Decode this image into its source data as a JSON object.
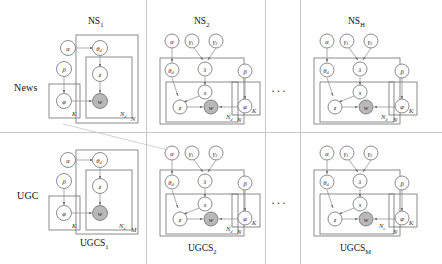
{
  "figure": {
    "type": "plate-notation-graphical-model",
    "row_labels": [
      {
        "id": "news",
        "text": "News"
      },
      {
        "id": "ugc",
        "text": "UGC"
      }
    ],
    "ellipsis": "···",
    "colors": {
      "observed_node_fill": "#b8b8b8",
      "latent_node_fill": "#ffffff",
      "stroke": "#6f6f6f",
      "edge": "#8a8a8a",
      "divider": "#c9c9c9"
    },
    "panels": [
      {
        "id": "ns1",
        "row": "news",
        "title": "NS",
        "title_sub": "1",
        "title_position": "top",
        "nodes": [
          {
            "name": "alpha",
            "label": "α",
            "observed": false
          },
          {
            "name": "theta-d",
            "label": "θ",
            "sub": "d",
            "observed": false
          },
          {
            "name": "beta",
            "label": "β",
            "observed": false
          },
          {
            "name": "phi",
            "label": "φ",
            "observed": false
          },
          {
            "name": "z",
            "label": "z",
            "observed": false
          },
          {
            "name": "w",
            "label": "w",
            "observed": true
          }
        ],
        "plates": [
          {
            "name": "documents-plate",
            "label": "N"
          },
          {
            "name": "words-plate",
            "label": "N",
            "sub": "d"
          },
          {
            "name": "topics-plate",
            "label": "K"
          }
        ],
        "edges": [
          {
            "from": "alpha",
            "to": "theta-d"
          },
          {
            "from": "theta-d",
            "to": "z"
          },
          {
            "from": "z",
            "to": "w"
          },
          {
            "from": "beta",
            "to": "phi"
          },
          {
            "from": "phi",
            "to": "w"
          }
        ]
      },
      {
        "id": "ns2",
        "row": "news",
        "title": "NS",
        "title_sub": "2",
        "title_position": "top",
        "nodes": [
          {
            "name": "alpha",
            "label": "α",
            "observed": false
          },
          {
            "name": "gamma-1",
            "label": "γ",
            "sub": "1",
            "observed": false
          },
          {
            "name": "gamma-2",
            "label": "γ",
            "sub": "2",
            "observed": false
          },
          {
            "name": "theta-d",
            "label": "θ",
            "sub": "d",
            "observed": false
          },
          {
            "name": "lambda",
            "label": "λ",
            "observed": false
          },
          {
            "name": "s",
            "label": "s",
            "observed": false
          },
          {
            "name": "z",
            "label": "z",
            "observed": false
          },
          {
            "name": "w",
            "label": "w",
            "observed": true
          },
          {
            "name": "beta",
            "label": "β",
            "observed": false
          },
          {
            "name": "phi",
            "label": "φ",
            "observed": false
          }
        ],
        "plates": [
          {
            "name": "documents-plate",
            "label": "N"
          },
          {
            "name": "words-plate",
            "label": "N",
            "sub": "d"
          },
          {
            "name": "topics-plate",
            "label": "K"
          }
        ],
        "edges": [
          {
            "from": "alpha",
            "to": "theta-d"
          },
          {
            "from": "gamma-1",
            "to": "lambda"
          },
          {
            "from": "gamma-2",
            "to": "lambda"
          },
          {
            "from": "lambda",
            "to": "s"
          },
          {
            "from": "theta-d",
            "to": "z"
          },
          {
            "from": "s",
            "to": "z"
          },
          {
            "from": "z",
            "to": "w"
          },
          {
            "from": "beta",
            "to": "phi"
          },
          {
            "from": "phi",
            "to": "w"
          }
        ]
      },
      {
        "id": "nsh",
        "row": "news",
        "title": "NS",
        "title_sub": "H",
        "title_position": "top",
        "nodes": [
          {
            "name": "alpha",
            "label": "α",
            "observed": false
          },
          {
            "name": "gamma-1",
            "label": "γ",
            "sub": "1",
            "observed": false
          },
          {
            "name": "gamma-2",
            "label": "γ",
            "sub": "2",
            "observed": false
          },
          {
            "name": "theta-d",
            "label": "θ",
            "sub": "d",
            "observed": false
          },
          {
            "name": "lambda",
            "label": "λ",
            "observed": false
          },
          {
            "name": "s",
            "label": "s",
            "observed": false
          },
          {
            "name": "z",
            "label": "z",
            "observed": false
          },
          {
            "name": "w",
            "label": "w",
            "observed": true
          },
          {
            "name": "beta",
            "label": "β",
            "observed": false
          },
          {
            "name": "phi",
            "label": "φ",
            "observed": false
          }
        ],
        "plates": [
          {
            "name": "documents-plate",
            "label": "N"
          },
          {
            "name": "words-plate",
            "label": "N",
            "sub": "d"
          },
          {
            "name": "topics-plate",
            "label": "K"
          }
        ],
        "edges": [
          {
            "from": "alpha",
            "to": "theta-d"
          },
          {
            "from": "gamma-1",
            "to": "lambda"
          },
          {
            "from": "gamma-2",
            "to": "lambda"
          },
          {
            "from": "lambda",
            "to": "s"
          },
          {
            "from": "theta-d",
            "to": "z"
          },
          {
            "from": "s",
            "to": "z"
          },
          {
            "from": "z",
            "to": "w"
          },
          {
            "from": "beta",
            "to": "phi"
          },
          {
            "from": "phi",
            "to": "w"
          }
        ]
      },
      {
        "id": "ugcs1",
        "row": "ugc",
        "title": "UGCS",
        "title_sub": "1",
        "title_position": "bottom",
        "nodes": [
          {
            "name": "alpha",
            "label": "α",
            "observed": false
          },
          {
            "name": "theta-d",
            "label": "θ",
            "sub": "d",
            "observed": false
          },
          {
            "name": "beta",
            "label": "β",
            "observed": false
          },
          {
            "name": "phi",
            "label": "φ",
            "observed": false
          },
          {
            "name": "z",
            "label": "z",
            "observed": false
          },
          {
            "name": "w",
            "label": "w",
            "observed": true
          }
        ],
        "plates": [
          {
            "name": "documents-plate",
            "label": "M"
          },
          {
            "name": "words-plate",
            "label": "N",
            "sub": "d"
          },
          {
            "name": "topics-plate",
            "label": "K"
          }
        ],
        "edges": [
          {
            "from": "alpha",
            "to": "theta-d"
          },
          {
            "from": "theta-d",
            "to": "z"
          },
          {
            "from": "z",
            "to": "w"
          },
          {
            "from": "beta",
            "to": "phi"
          },
          {
            "from": "phi",
            "to": "w"
          }
        ]
      },
      {
        "id": "ugcs2",
        "row": "ugc",
        "title": "UGCS",
        "title_sub": "2",
        "title_position": "bottom",
        "nodes": [
          {
            "name": "alpha",
            "label": "α",
            "observed": false
          },
          {
            "name": "gamma-1",
            "label": "γ",
            "sub": "1",
            "observed": false
          },
          {
            "name": "gamma-2",
            "label": "γ",
            "sub": "2",
            "observed": false
          },
          {
            "name": "theta-d",
            "label": "θ",
            "sub": "d",
            "observed": false
          },
          {
            "name": "lambda",
            "label": "λ",
            "observed": false
          },
          {
            "name": "s",
            "label": "s",
            "observed": false
          },
          {
            "name": "z",
            "label": "z",
            "observed": false
          },
          {
            "name": "w",
            "label": "w",
            "observed": true
          },
          {
            "name": "beta",
            "label": "β",
            "observed": false
          },
          {
            "name": "phi",
            "label": "φ",
            "observed": false
          }
        ],
        "plates": [
          {
            "name": "documents-plate",
            "label": "N"
          },
          {
            "name": "words-plate",
            "label": "N",
            "sub": "d"
          },
          {
            "name": "topics-plate",
            "label": "K"
          }
        ],
        "edges": [
          {
            "from": "alpha",
            "to": "theta-d"
          },
          {
            "from": "gamma-1",
            "to": "lambda"
          },
          {
            "from": "gamma-2",
            "to": "lambda"
          },
          {
            "from": "lambda",
            "to": "s"
          },
          {
            "from": "theta-d",
            "to": "z"
          },
          {
            "from": "s",
            "to": "z"
          },
          {
            "from": "z",
            "to": "w"
          },
          {
            "from": "beta",
            "to": "phi"
          },
          {
            "from": "phi",
            "to": "w"
          }
        ]
      },
      {
        "id": "ugcsm",
        "row": "ugc",
        "title": "UGCS",
        "title_sub": "M",
        "title_position": "bottom",
        "nodes": [
          {
            "name": "alpha",
            "label": "α",
            "observed": false
          },
          {
            "name": "gamma-1",
            "label": "γ",
            "sub": "1",
            "observed": false
          },
          {
            "name": "gamma-2",
            "label": "γ",
            "sub": "2",
            "observed": false
          },
          {
            "name": "theta-d",
            "label": "θ",
            "sub": "d",
            "observed": false
          },
          {
            "name": "lambda",
            "label": "λ",
            "observed": false
          },
          {
            "name": "s",
            "label": "s",
            "observed": false
          },
          {
            "name": "z",
            "label": "z",
            "observed": false
          },
          {
            "name": "w",
            "label": "w",
            "observed": true
          },
          {
            "name": "beta",
            "label": "β",
            "observed": false
          },
          {
            "name": "phi",
            "label": "φ",
            "observed": false
          }
        ],
        "plates": [
          {
            "name": "documents-plate",
            "label": "N"
          },
          {
            "name": "words-plate",
            "label": "N",
            "sub": "c"
          },
          {
            "name": "topics-plate",
            "label": "K"
          }
        ],
        "edges": [
          {
            "from": "alpha",
            "to": "theta-d"
          },
          {
            "from": "gamma-1",
            "to": "lambda"
          },
          {
            "from": "gamma-2",
            "to": "lambda"
          },
          {
            "from": "lambda",
            "to": "s"
          },
          {
            "from": "theta-d",
            "to": "z"
          },
          {
            "from": "s",
            "to": "z"
          },
          {
            "from": "z",
            "to": "w"
          },
          {
            "from": "beta",
            "to": "phi"
          },
          {
            "from": "phi",
            "to": "w"
          }
        ]
      }
    ]
  }
}
